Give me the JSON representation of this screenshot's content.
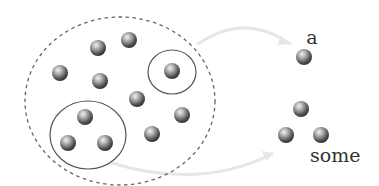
{
  "diagram": {
    "type": "set-selection-illustration",
    "colors": {
      "background": "#ffffff",
      "dashed_boundary": "#666666",
      "solid_group": "#555555",
      "arrow": "#e6e6e6",
      "ball_light": "#f2f2f2",
      "ball_mid": "#8a8a8a",
      "ball_dark": "#2e2e2e",
      "label": "#333333"
    },
    "universe": {
      "shape": "dashed-ellipse",
      "cx": 120,
      "cy": 101,
      "rx": 95,
      "ry": 84
    },
    "groups": [
      {
        "name": "single-group",
        "cx": 172,
        "cy": 72,
        "rx": 24,
        "ry": 22
      },
      {
        "name": "triple-group",
        "cx": 88,
        "cy": 135,
        "rx": 38,
        "ry": 34
      }
    ],
    "balls": [
      {
        "x": 98,
        "y": 48
      },
      {
        "x": 129,
        "y": 40
      },
      {
        "x": 60,
        "y": 73
      },
      {
        "x": 100,
        "y": 81
      },
      {
        "x": 172,
        "y": 71
      },
      {
        "x": 137,
        "y": 99
      },
      {
        "x": 182,
        "y": 115
      },
      {
        "x": 152,
        "y": 134
      },
      {
        "x": 85,
        "y": 117
      },
      {
        "x": 68,
        "y": 143
      },
      {
        "x": 105,
        "y": 143
      }
    ],
    "ball_radius": 8,
    "outputs": [
      {
        "label": "a",
        "label_x": 312,
        "label_y": 44,
        "balls": [
          {
            "x": 304,
            "y": 57
          }
        ]
      },
      {
        "label": "some",
        "label_x": 310,
        "label_y": 162,
        "balls": [
          {
            "x": 301,
            "y": 109
          },
          {
            "x": 286,
            "y": 135
          },
          {
            "x": 321,
            "y": 135
          }
        ]
      }
    ],
    "arrows": [
      {
        "name": "arrow-to-a",
        "path": "M 198 44 Q 245 12 290 44",
        "head": "290,44"
      },
      {
        "name": "arrow-to-some",
        "path": "M 112 163 Q 200 190 272 154",
        "head": "272,154"
      }
    ]
  }
}
